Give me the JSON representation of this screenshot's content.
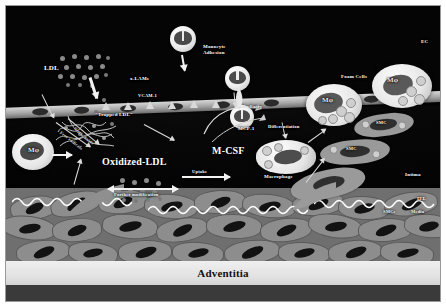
{
  "figure": {
    "background_color": "#050505",
    "frame_color": "#ffffff"
  },
  "layers": {
    "lumen_label": "",
    "intima": "Intima",
    "media": "Media",
    "adventitia": "Adventitia",
    "iel": "IEL",
    "smcs": "SMCs",
    "ec": "EC"
  },
  "labels": {
    "ldl": "LDL",
    "x_lams": "x-LAMs",
    "vcam1": "VCAM-1",
    "trapped_ldl": "\"Trapped LDL\"",
    "monocyte_adhesion_line1": "Monocyte",
    "monocyte_adhesion_line2": "Adhesion",
    "entry": "Entry",
    "mcp1": "MCP-1",
    "mcsf": "M-CSF",
    "oxidized_ldl": "Oxidized-LDL",
    "differentiation": "Differentiation",
    "macrophage": "Macrophage",
    "uptake": "Uptake",
    "further_modification": "Further modification",
    "foam_cells": "Foam Cells",
    "mphi": "Mφ",
    "smc": "SMC",
    "ec": "EC",
    "free_radicals": "Free radicals",
    "nitric_oxide": "Nitric oxide"
  },
  "cells": {
    "monocytes": [
      {
        "name": "monocyte-top",
        "x": 168,
        "y": 22,
        "d": 26
      },
      {
        "name": "monocyte-adhering",
        "x": 222,
        "y": 62,
        "d": 25
      },
      {
        "name": "monocyte-entering",
        "x": 228,
        "y": 100,
        "d": 24
      }
    ],
    "foam_cells": [
      {
        "name": "foam-cell-right-1",
        "x": 308,
        "y": 82,
        "w": 52,
        "h": 38
      },
      {
        "name": "foam-cell-right-2",
        "x": 372,
        "y": 62,
        "w": 56,
        "h": 40
      },
      {
        "name": "foam-cell-macrophage",
        "x": 252,
        "y": 138,
        "w": 58,
        "h": 32
      }
    ],
    "macrophages": [
      {
        "name": "macrophage-left",
        "x": 8,
        "y": 130,
        "w": 40,
        "h": 34
      }
    ],
    "smc_cells": [
      {
        "name": "smc-upper",
        "x": 352,
        "y": 112,
        "w": 56,
        "h": 22
      },
      {
        "name": "smc-mid",
        "x": 318,
        "y": 136,
        "w": 66,
        "h": 24
      },
      {
        "name": "smc-migrating",
        "x": 288,
        "y": 168,
        "w": 72,
        "h": 28
      }
    ]
  },
  "ldl_particles": {
    "cluster_top": {
      "name": "ldl-cluster-lumen",
      "count": 17
    },
    "cluster_mid": {
      "name": "ldl-cluster-oxidized",
      "count": 12
    }
  },
  "colors": {
    "lumen": "#050505",
    "endothelium": "#b9b9b9",
    "media": "#6f6f6f",
    "adventitia": "#e8e8e8",
    "cell_cytoplasm": "#ededed",
    "nucleus": "#3a3a3a",
    "ldl_particle": "#8a8a8a",
    "arrow": "#f2f2f2",
    "label_text": "#ffffff"
  }
}
